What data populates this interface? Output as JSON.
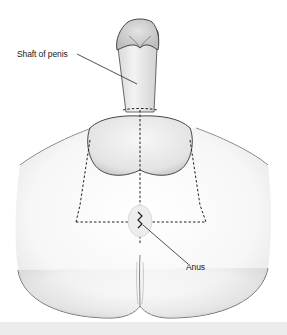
{
  "figure": {
    "labels": [
      {
        "id": "shaft",
        "text": "Shaft of penis"
      },
      {
        "id": "anus",
        "text": "Anus"
      }
    ],
    "colors": {
      "outline": "#333333",
      "shading": "#cfcfcf",
      "skin_fill": "#f2f2f2",
      "dashed_line": "#222222",
      "leader_line": "#222222",
      "bottom_band": "#ececec"
    }
  }
}
